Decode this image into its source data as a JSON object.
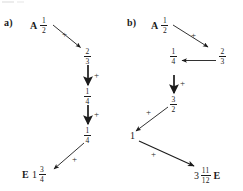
{
  "document": {
    "title": "Arrow chain fraction diagrams",
    "ink_color": "#1b1b1b",
    "background_color": "#ffffff"
  },
  "diagrams": [
    {
      "id": "a",
      "label": "a)",
      "start_tag": "A",
      "end_tag": "E",
      "operator": "+",
      "nodes": [
        {
          "name": "start",
          "whole": "",
          "num": "1",
          "den": "2"
        },
        {
          "name": "step1",
          "whole": "",
          "num": "2",
          "den": "3"
        },
        {
          "name": "step2",
          "whole": "",
          "num": "1",
          "den": "4"
        },
        {
          "name": "step3",
          "whole": "",
          "num": "1",
          "den": "4"
        },
        {
          "name": "end",
          "whole": "1",
          "num": "3",
          "den": "4"
        }
      ],
      "operators": [
        "+",
        "+",
        "+",
        "+"
      ]
    },
    {
      "id": "b",
      "label": "b)",
      "start_tag": "A",
      "end_tag": "E",
      "operator": "+",
      "nodes": [
        {
          "name": "start",
          "whole": "",
          "num": "1",
          "den": "2"
        },
        {
          "name": "step1",
          "whole": "",
          "num": "2",
          "den": "3"
        },
        {
          "name": "step2",
          "whole": "",
          "num": "1",
          "den": "4"
        },
        {
          "name": "step3",
          "whole": "",
          "num": "3",
          "den": "2"
        },
        {
          "name": "step4",
          "whole": "1",
          "num": "",
          "den": ""
        },
        {
          "name": "end",
          "whole": "3",
          "num": "11",
          "den": "12"
        }
      ],
      "operators": [
        "+",
        "+",
        "+",
        "+",
        "+"
      ]
    }
  ]
}
